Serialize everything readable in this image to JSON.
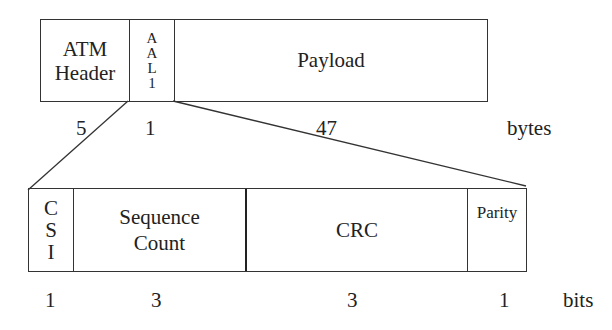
{
  "top_cell": {
    "fields": [
      {
        "name": "atm-header",
        "label_lines": [
          "ATM",
          "Header"
        ],
        "size": "5"
      },
      {
        "name": "aal1",
        "label_lines": [
          "A",
          "A",
          "L",
          "1"
        ],
        "size": "1"
      },
      {
        "name": "payload",
        "label_lines": [
          "Payload"
        ],
        "size": "47"
      }
    ],
    "unit": "bytes"
  },
  "aal1_header": {
    "fields": [
      {
        "name": "csi",
        "label_lines": [
          "C",
          "S",
          "I"
        ],
        "size": "1"
      },
      {
        "name": "sequence-count",
        "label_lines": [
          "Sequence",
          "Count"
        ],
        "size": "3"
      },
      {
        "name": "crc",
        "label_lines": [
          "CRC"
        ],
        "size": "3"
      },
      {
        "name": "parity",
        "label_lines": [
          "Parity"
        ],
        "size": "1"
      }
    ],
    "unit": "bits"
  }
}
